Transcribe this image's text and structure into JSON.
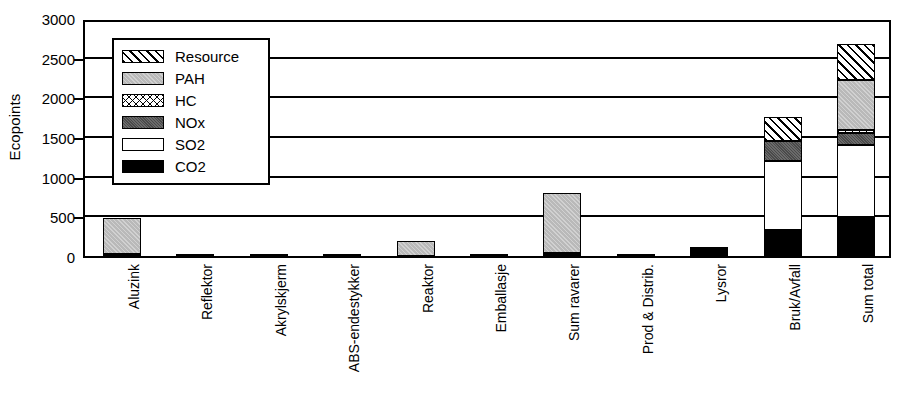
{
  "chart_data": {
    "type": "bar",
    "subtype": "stacked-bar",
    "title": "",
    "xlabel": "",
    "ylabel": "Ecopoints",
    "ylim": [
      0,
      3000
    ],
    "ytick_values": [
      0,
      500,
      1000,
      1500,
      2000,
      2500,
      3000
    ],
    "ytick_labels": [
      "0",
      "500",
      "1000",
      "1500",
      "2000",
      "2500",
      "3000"
    ],
    "grid": true,
    "legend_position": "upper-left-inside",
    "categories": [
      "Aluzink",
      "Reflektor",
      "Akrylskjerm",
      "ABS-endestykker",
      "Reaktor",
      "Emballasje",
      "Sum ravarer",
      "Prod & Distrib.",
      "Lysror",
      "Bruk/Avfall",
      "Sum total"
    ],
    "series": [
      {
        "name": "CO2",
        "color": "#000000",
        "pattern": "solid-black",
        "values": [
          25,
          10,
          8,
          4,
          5,
          2,
          30,
          5,
          110,
          330,
          490
        ]
      },
      {
        "name": "SO2",
        "color": "#ffffff",
        "pattern": "solid-white",
        "values": [
          0,
          0,
          0,
          0,
          0,
          0,
          5,
          0,
          0,
          870,
          910
        ]
      },
      {
        "name": "NOx",
        "color": "#4a4a4a",
        "pattern": "dark-gray",
        "values": [
          0,
          0,
          0,
          0,
          0,
          0,
          0,
          0,
          0,
          250,
          150
        ]
      },
      {
        "name": "HC",
        "color": "#ffffff",
        "pattern": "cross-hatch",
        "values": [
          0,
          0,
          0,
          0,
          0,
          0,
          0,
          0,
          0,
          0,
          40
        ]
      },
      {
        "name": "PAH",
        "color": "#b9b9b9",
        "pattern": "light-gray",
        "values": [
          450,
          0,
          0,
          0,
          185,
          0,
          765,
          0,
          0,
          0,
          630
        ]
      },
      {
        "name": "Resource",
        "color": "#ffffff",
        "pattern": "diag-hatch",
        "values": [
          0,
          0,
          0,
          0,
          0,
          0,
          0,
          0,
          0,
          300,
          450
        ]
      }
    ],
    "totals": [
      475,
      10,
      8,
      4,
      190,
      2,
      800,
      5,
      110,
      1750,
      2670
    ]
  },
  "legend": {
    "items": [
      {
        "label": "Resource",
        "swatch": "sw-res"
      },
      {
        "label": "PAH",
        "swatch": "sw-pah"
      },
      {
        "label": "HC",
        "swatch": "sw-hc"
      },
      {
        "label": "NOx",
        "swatch": "sw-nox"
      },
      {
        "label": "SO2",
        "swatch": "sw-so2"
      },
      {
        "label": "CO2",
        "swatch": "sw-co2"
      }
    ]
  }
}
